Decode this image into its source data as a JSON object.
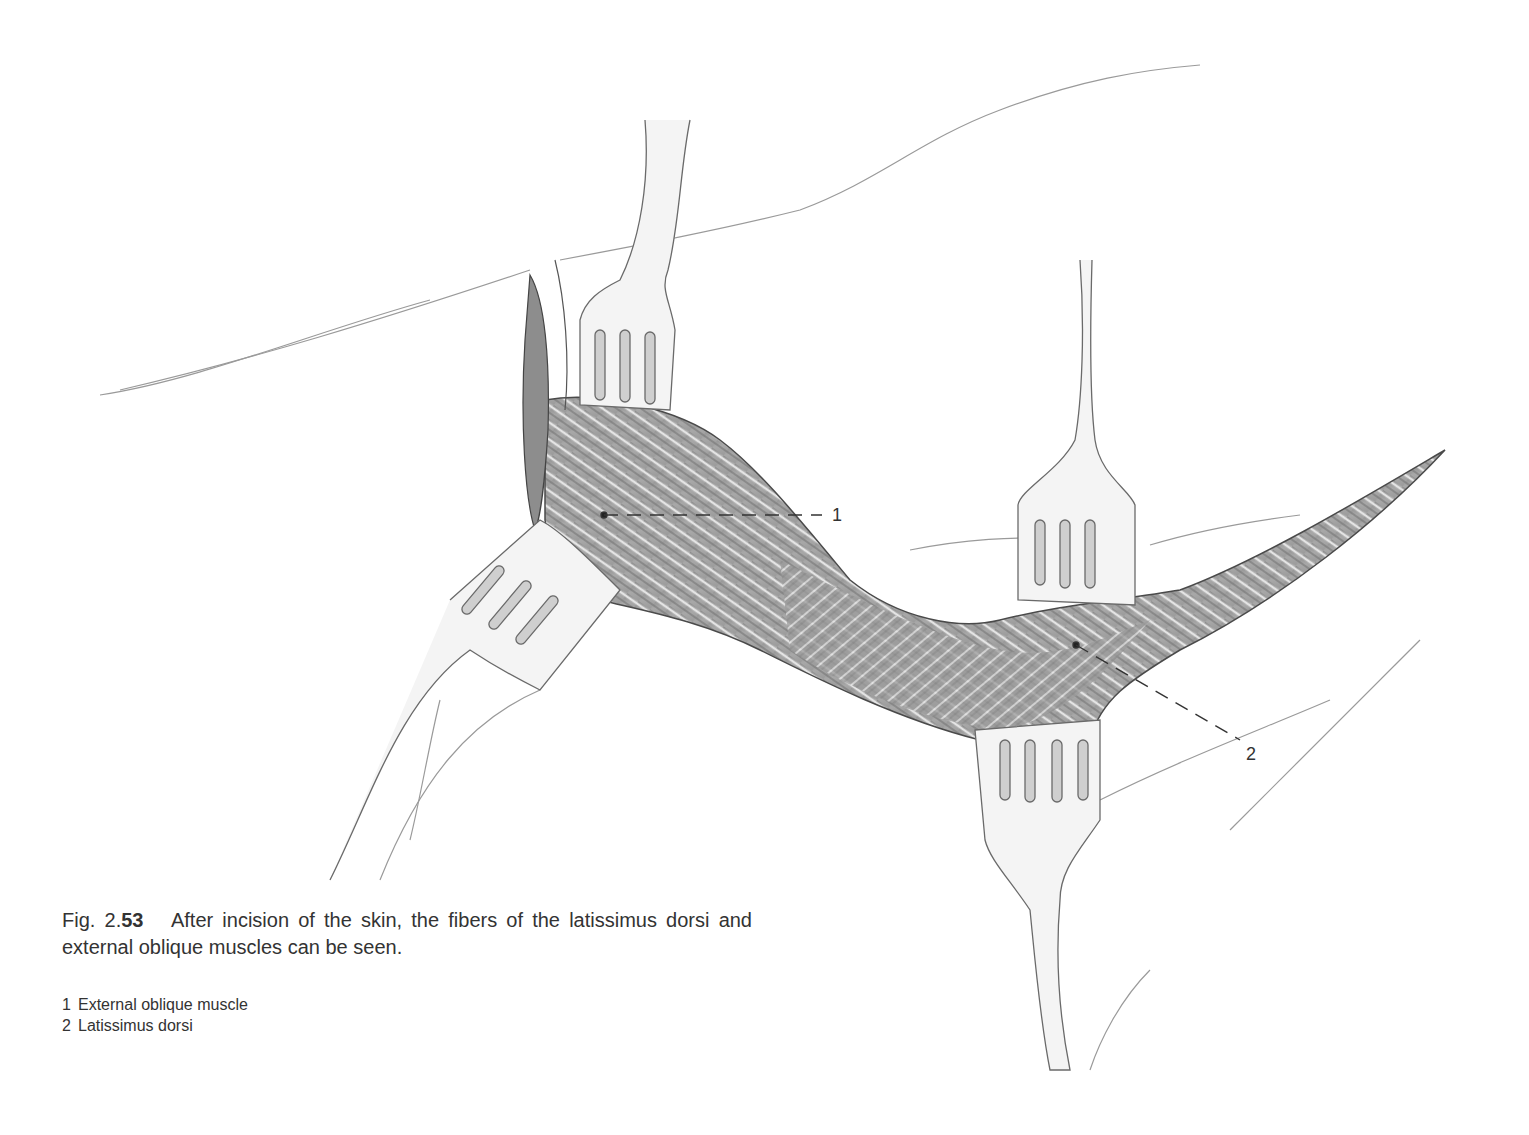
{
  "figure": {
    "number_prefix": "Fig. 2.",
    "number_bold": "53",
    "caption": "After incision of the skin, the fibers of the latissimus dorsi and external oblique muscles can be seen.",
    "callouts": [
      {
        "id": "1",
        "label": "1"
      },
      {
        "id": "2",
        "label": "2"
      }
    ],
    "legend": [
      {
        "num": "1",
        "text": "External oblique muscle"
      },
      {
        "num": "2",
        "text": "Latissimus dorsi"
      }
    ]
  }
}
